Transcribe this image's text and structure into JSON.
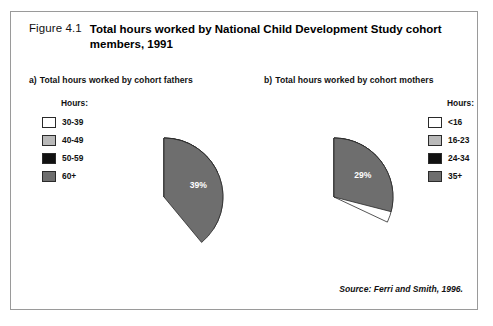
{
  "figure": {
    "number": "Figure 4.1",
    "title": "Total hours worked by National Child Development Study cohort members, 1991",
    "source": "Source: Ferri and Smith, 1996."
  },
  "panels": [
    {
      "marker": "a)",
      "caption": "Total hours worked by cohort fathers",
      "legend_title": "Hours:"
    },
    {
      "marker": "b)",
      "caption": "Total hours worked by cohort mothers",
      "legend_title": "Hours:"
    }
  ],
  "colors": {
    "white": "#ffffff",
    "light_gray": "#b9b9b9",
    "black": "#111111",
    "dark_gray": "#6e6e6e",
    "outline": "#2a2a2a",
    "frame": "#9a9a9a"
  },
  "chart_data": [
    {
      "type": "pie",
      "title": "Total hours worked by cohort fathers",
      "legend_title": "Hours:",
      "categories": [
        "30-39",
        "40-49",
        "50-59",
        "60+"
      ],
      "values": [
        34,
        9,
        18,
        39
      ],
      "labels": [
        "34%",
        "9%",
        "18%",
        "39%"
      ],
      "colors": [
        "#ffffff",
        "#b9b9b9",
        "#111111",
        "#6e6e6e"
      ],
      "units": "percent",
      "legend_position": "left",
      "start_angle_deg": 0
    },
    {
      "type": "pie",
      "title": "Total hours worked by cohort mothers",
      "legend_title": "Hours:",
      "categories": [
        "<16",
        "16-23",
        "24-34",
        "35+"
      ],
      "values": [
        32,
        23,
        16,
        29
      ],
      "labels": [
        "32%",
        "23%",
        "16%",
        "29%"
      ],
      "colors": [
        "#ffffff",
        "#b9b9b9",
        "#111111",
        "#6e6e6e"
      ],
      "units": "percent",
      "legend_position": "right",
      "start_angle_deg": 0
    }
  ]
}
